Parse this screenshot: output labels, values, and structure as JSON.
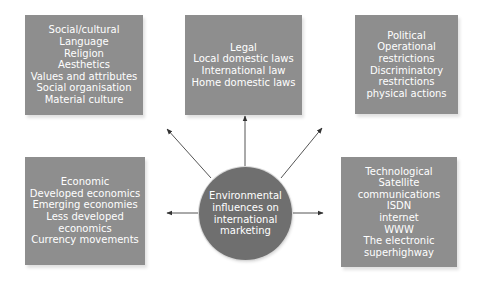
{
  "diagram": {
    "center": {
      "lines": [
        "Environmental",
        "influences on",
        "international",
        "marketing"
      ]
    },
    "boxes": {
      "social": {
        "lines": [
          "Social/cultural",
          "Language",
          "Religion",
          "Aesthetics",
          "Values and attributes",
          "Social organisation",
          "Material culture"
        ]
      },
      "legal": {
        "lines": [
          "Legal",
          "Local domestic laws",
          "International law",
          "Home domestic laws"
        ]
      },
      "political": {
        "lines": [
          "Political",
          "Operational",
          "restrictions",
          "Discriminatory",
          "restrictions",
          "physical actions"
        ]
      },
      "economic": {
        "lines": [
          "Economic",
          "Developed economics",
          "Emerging economies",
          "Less developed",
          "economics",
          "Currency movements"
        ]
      },
      "technological": {
        "lines": [
          "Technological",
          "Satellite",
          "communications",
          "ISDN",
          "internet",
          "WWW",
          "The electronic",
          "superhighway"
        ]
      }
    },
    "arrows": [
      {
        "from": "center",
        "to": "social"
      },
      {
        "from": "center",
        "to": "legal"
      },
      {
        "from": "center",
        "to": "political"
      },
      {
        "from": "center",
        "to": "economic"
      },
      {
        "from": "center",
        "to": "technological"
      }
    ],
    "colors": {
      "box_fill": "#8e8e8e",
      "circle_fill": "#6f6f6f",
      "text": "#ffffff",
      "arrow": "#444444"
    }
  }
}
